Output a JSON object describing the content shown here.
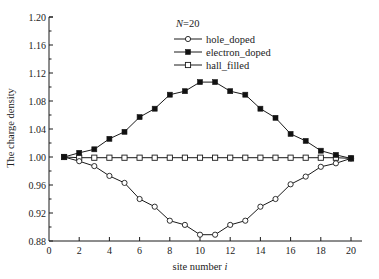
{
  "chart_data": {
    "type": "line",
    "title": "",
    "annotation": "N=20",
    "annotation_parts": {
      "italic": "N",
      "rest": "=20"
    },
    "xlabel": "site number i",
    "xlabel_parts": {
      "text": "site number ",
      "italic": "i"
    },
    "ylabel": "The charge density",
    "xlim": [
      0,
      21
    ],
    "ylim": [
      0.88,
      1.2
    ],
    "grid": false,
    "legend_position": "upper-center",
    "x_ticks": [
      0,
      2,
      4,
      6,
      8,
      10,
      12,
      14,
      16,
      18,
      20
    ],
    "x_tick_labels": [
      "0",
      "2",
      "4",
      "6",
      "8",
      "10",
      "12",
      "14",
      "16",
      "18",
      "20"
    ],
    "y_ticks": [
      0.88,
      0.92,
      0.96,
      1.0,
      1.04,
      1.08,
      1.12,
      1.16,
      1.2
    ],
    "y_tick_labels": [
      "0.88",
      "0.92",
      "0.96",
      "1.00",
      "1.04",
      "1.08",
      "1.12",
      "1.16",
      "1.20"
    ],
    "x": [
      1,
      2,
      3,
      4,
      5,
      6,
      7,
      8,
      9,
      10,
      11,
      12,
      13,
      14,
      15,
      16,
      17,
      18,
      19,
      20
    ],
    "series": [
      {
        "name": "hole_doped",
        "marker": "open-circle",
        "values": [
          1.0,
          0.994,
          0.987,
          0.973,
          0.963,
          0.94,
          0.929,
          0.909,
          0.903,
          0.889,
          0.889,
          0.903,
          0.909,
          0.929,
          0.94,
          0.961,
          0.972,
          0.986,
          0.991,
          0.998
        ]
      },
      {
        "name": "electron_doped",
        "marker": "filled-square",
        "values": [
          1.0,
          1.006,
          1.011,
          1.026,
          1.036,
          1.057,
          1.069,
          1.089,
          1.094,
          1.107,
          1.107,
          1.094,
          1.089,
          1.069,
          1.056,
          1.033,
          1.023,
          1.009,
          1.003,
          0.998
        ]
      },
      {
        "name": "hall_filled",
        "marker": "open-square",
        "values": [
          1.0,
          0.999,
          0.999,
          0.999,
          0.999,
          0.999,
          0.999,
          0.999,
          0.999,
          0.999,
          0.999,
          0.999,
          0.999,
          0.999,
          0.999,
          0.999,
          0.999,
          0.999,
          0.999,
          0.998
        ]
      }
    ]
  },
  "colors": {
    "line": "#1a1a1a",
    "marker_fill_open": "#ffffff",
    "marker_fill_filled": "#111111",
    "background": "#ffffff"
  }
}
